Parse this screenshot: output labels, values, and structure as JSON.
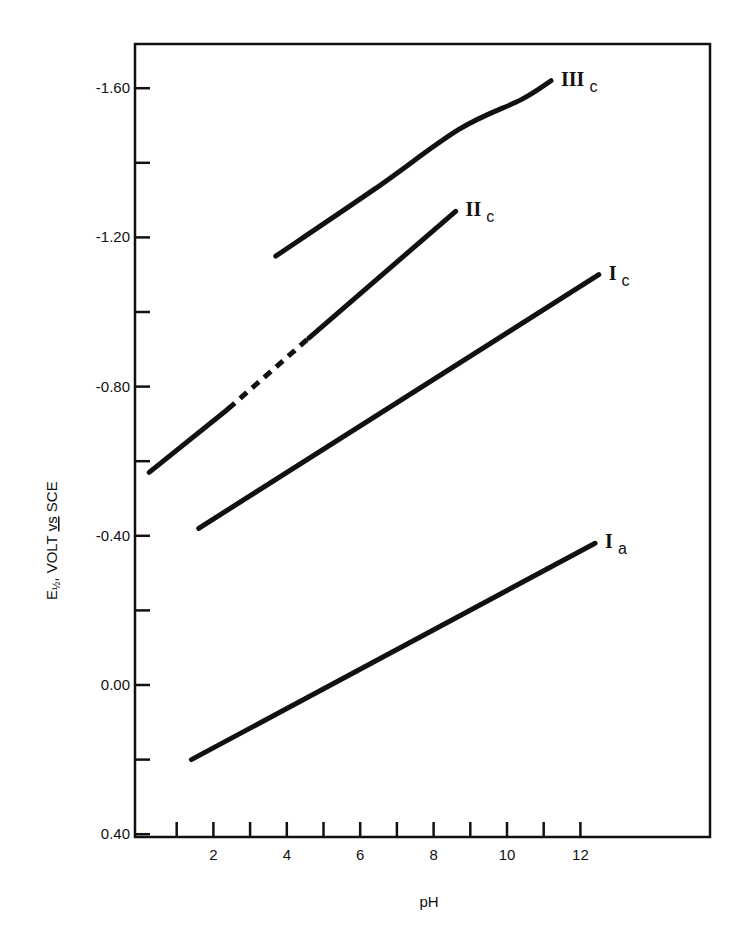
{
  "chart_data": {
    "type": "line",
    "title": "",
    "xlabel": "pH",
    "ylabel": "E½, VOLT vs SCE",
    "ylabel_parts": {
      "main": "E",
      "sub": "½",
      "rest": ", VOLT ",
      "underlined": "vs",
      "end": " SCE"
    },
    "xlim": [
      0,
      15.5
    ],
    "ylim": [
      0.4,
      -1.75
    ],
    "x_ticks": [
      1,
      2,
      3,
      4,
      5,
      6,
      7,
      8,
      9,
      10,
      11,
      12
    ],
    "x_tick_labels": [
      {
        "value": 2,
        "label": "2"
      },
      {
        "value": 4,
        "label": "4"
      },
      {
        "value": 6,
        "label": "6"
      },
      {
        "value": 8,
        "label": "8"
      },
      {
        "value": 10,
        "label": "10"
      },
      {
        "value": 12,
        "label": "12"
      }
    ],
    "y_ticks": [
      0.4,
      0.2,
      0.0,
      -0.2,
      -0.4,
      -0.6,
      -0.8,
      -1.0,
      -1.2,
      -1.4,
      -1.6
    ],
    "y_tick_labels": [
      {
        "value": 0.4,
        "label": "0.40"
      },
      {
        "value": 0.0,
        "label": "0.00"
      },
      {
        "value": -0.4,
        "label": "-0.40"
      },
      {
        "value": -0.8,
        "label": "-0.80"
      },
      {
        "value": -1.2,
        "label": "-1.20"
      },
      {
        "value": -1.6,
        "label": "-1.60"
      }
    ],
    "grid": false,
    "legend": "inline labels at line ends",
    "series": [
      {
        "name": "III c",
        "label_main": "III",
        "label_sub": "c",
        "x": [
          3.7,
          6.4,
          8.7,
          10.4,
          11.2
        ],
        "y": [
          -1.15,
          -1.33,
          -1.49,
          -1.57,
          -1.62
        ],
        "smooth": true
      },
      {
        "name": "II c",
        "label_main": "II",
        "label_sub": "c",
        "x": [
          0.25,
          2.4,
          4.6,
          8.6
        ],
        "y": [
          -0.57,
          -0.74,
          -0.93,
          -1.27
        ],
        "dashed_segment_pH": [
          2.4,
          4.6
        ]
      },
      {
        "name": "I c",
        "label_main": "I",
        "label_sub": "c",
        "x": [
          1.6,
          12.5
        ],
        "y": [
          -0.42,
          -1.1
        ]
      },
      {
        "name": "I a",
        "label_main": "I",
        "label_sub": "a",
        "x": [
          1.4,
          12.4
        ],
        "y": [
          0.2,
          -0.38
        ]
      }
    ]
  }
}
